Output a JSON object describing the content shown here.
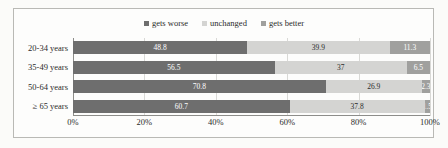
{
  "chart_data": {
    "type": "bar",
    "subtype": "stacked-horizontal-100pct",
    "title": "",
    "xlabel": "",
    "ylabel": "",
    "categories": [
      "20-34 years",
      "35-49 years",
      "50-64 years",
      "≥ 65 years"
    ],
    "series": [
      {
        "name": "gets worse",
        "color": "#6e6e6e",
        "values": [
          48.8,
          56.5,
          70.8,
          60.7
        ]
      },
      {
        "name": "unchanged",
        "color": "#d4d4d2",
        "values": [
          39.9,
          37,
          26.9,
          37.8
        ]
      },
      {
        "name": "gets better",
        "color": "#a0a09e",
        "values": [
          11.3,
          6.5,
          2.3,
          1.5
        ]
      }
    ],
    "value_labels": [
      [
        "48.8",
        "39.9",
        "11.3"
      ],
      [
        "56.5",
        "37",
        "6.5"
      ],
      [
        "70.8",
        "26.9",
        "2.3"
      ],
      [
        "60.7",
        "37.8",
        "1.5"
      ]
    ],
    "xlim": [
      0,
      100
    ],
    "xticks": [
      0,
      20,
      40,
      60,
      80,
      100
    ],
    "xtick_labels": [
      "0%",
      "20%",
      "40%",
      "60%",
      "80%",
      "100%"
    ],
    "grid": true,
    "grid_axis": "x",
    "legend_position": "top-center"
  },
  "legend": {
    "items": [
      {
        "label": "gets worse",
        "color": "#6e6e6e"
      },
      {
        "label": "unchanged",
        "color": "#d4d4d2"
      },
      {
        "label": "gets better",
        "color": "#a0a09e"
      }
    ]
  },
  "colors": {
    "gets_worse": "#6e6e6e",
    "unchanged": "#d4d4d2",
    "gets_better": "#a0a09e",
    "frame": "#b9b9b5",
    "gridline": "#d9d9d6",
    "axis": "#8d8d8a",
    "background": "#fbfbf9",
    "text": "#2b2b2b"
  }
}
